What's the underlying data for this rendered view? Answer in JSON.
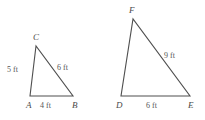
{
  "figure": {
    "unit": "ft",
    "stroke_color": "#4f4f4f",
    "label_color": "#4a4a4a",
    "measure_color": "#555555",
    "background_color": "#ffffff"
  },
  "triangles": [
    {
      "id": "triangle-abc",
      "name": "Triangle ABC",
      "vertices": [
        {
          "label": "A",
          "x": 30,
          "y": 96
        },
        {
          "label": "B",
          "x": 73,
          "y": 96
        },
        {
          "label": "C",
          "x": 36,
          "y": 46
        }
      ],
      "vertex_labels": [
        {
          "text": "A",
          "x": 26,
          "y": 108
        },
        {
          "text": "B",
          "x": 72,
          "y": 108
        },
        {
          "text": "C",
          "x": 33,
          "y": 40
        }
      ],
      "measures": [
        {
          "text": "5 ft",
          "value": 5,
          "unit": "ft",
          "side": "AC",
          "x": 7,
          "y": 72
        },
        {
          "text": "6 ft",
          "value": 6,
          "unit": "ft",
          "side": "CB",
          "x": 57,
          "y": 70
        },
        {
          "text": "4 ft",
          "value": 4,
          "unit": "ft",
          "side": "AB",
          "x": 40,
          "y": 108
        }
      ]
    },
    {
      "id": "triangle-def",
      "name": "Triangle DEF",
      "vertices": [
        {
          "label": "D",
          "x": 121,
          "y": 96
        },
        {
          "label": "E",
          "x": 190,
          "y": 96
        },
        {
          "label": "F",
          "x": 133,
          "y": 19
        }
      ],
      "vertex_labels": [
        {
          "text": "D",
          "x": 116,
          "y": 108
        },
        {
          "text": "E",
          "x": 188,
          "y": 108
        },
        {
          "text": "F",
          "x": 129,
          "y": 13
        }
      ],
      "measures": [
        {
          "text": "9 ft",
          "value": 9,
          "unit": "ft",
          "side": "FE",
          "x": 164,
          "y": 58
        },
        {
          "text": "6 ft",
          "value": 6,
          "unit": "ft",
          "side": "DE",
          "x": 146,
          "y": 108
        }
      ]
    }
  ]
}
